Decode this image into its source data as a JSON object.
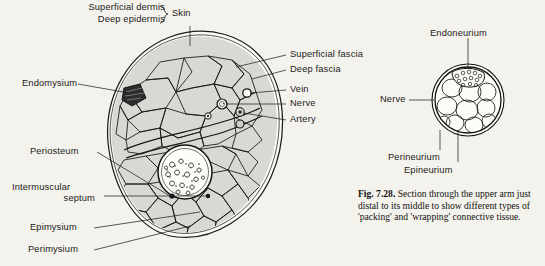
{
  "figure": {
    "number": "Fig. 7.28.",
    "caption": "Section through the upper arm just distal to its middle to show different types of 'packing' and 'wrapping' connective tissue.",
    "background_color": "#f4f2ec",
    "ink_color": "#161616",
    "muscle_fill": "#d8d8d4"
  },
  "labels": {
    "superficial_dermis": "Superficial dermis",
    "deep_epidermis": "Deep epidermis",
    "skin": "Skin",
    "endomysium": "Endomysium",
    "superficial_fascia": "Superficial fascia",
    "deep_fascia": "Deep fascia",
    "vein": "Vein",
    "nerve": "Nerve",
    "artery": "Artery",
    "periosteum": "Periosteum",
    "intermuscular": "Intermuscular",
    "septum": "septum",
    "epimysium": "Epimysium",
    "perimysium": "Perimysium",
    "endoneurium": "Endoneurium",
    "nerve_right": "Nerve",
    "perineurium": "Perineurium",
    "epineurium": "Epineurium"
  },
  "diagrams": {
    "main": {
      "name": "upper-arm-cross-section",
      "center_x": 185,
      "center_y": 140,
      "bone_label": "humerus-marrow"
    },
    "inset": {
      "name": "nerve-cross-section",
      "center_x": 468,
      "center_y": 100,
      "radius": 37
    }
  }
}
